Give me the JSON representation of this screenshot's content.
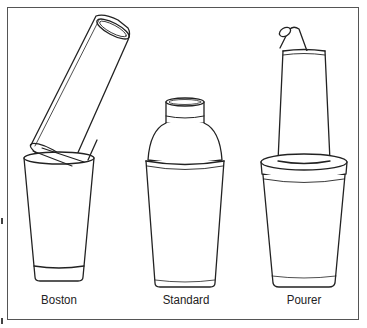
{
  "figure": {
    "items": [
      {
        "name": "boston",
        "label": "Boston"
      },
      {
        "name": "standard",
        "label": "Standard"
      },
      {
        "name": "pourer",
        "label": "Pourer"
      }
    ],
    "colors": {
      "line": "#222222",
      "frame": "#555555",
      "background": "#ffffff"
    }
  }
}
